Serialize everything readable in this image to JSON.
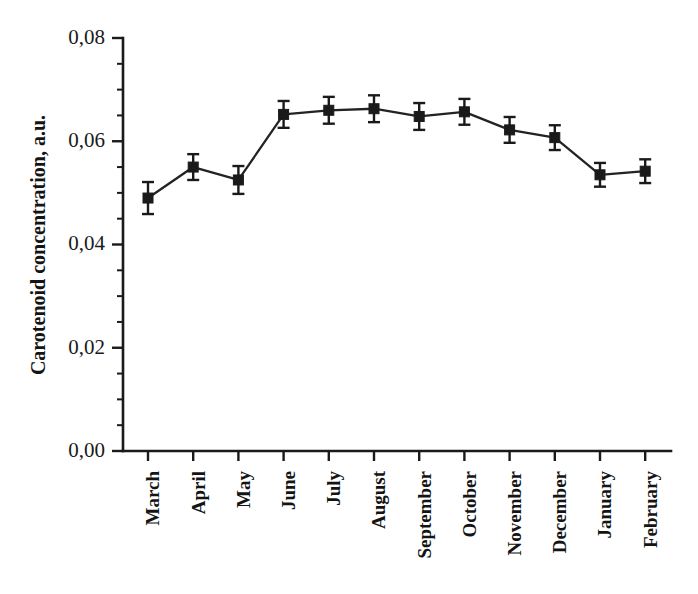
{
  "chart_data": {
    "type": "line",
    "title": "",
    "xlabel": "",
    "ylabel": "Carotenoid concentration, a.u.",
    "categories": [
      "March",
      "April",
      "May",
      "June",
      "July",
      "August",
      "September",
      "October",
      "November",
      "December",
      "January",
      "February"
    ],
    "values": [
      0.049,
      0.055,
      0.0525,
      0.0652,
      0.066,
      0.0663,
      0.0648,
      0.0657,
      0.0622,
      0.0607,
      0.0535,
      0.0542
    ],
    "errors": [
      0.0031,
      0.0025,
      0.0027,
      0.0026,
      0.0026,
      0.0026,
      0.0026,
      0.0025,
      0.0025,
      0.0024,
      0.0023,
      0.0023
    ],
    "ylim": [
      0.0,
      0.08
    ],
    "ytick_labels": [
      "0,00",
      "0,02",
      "0,04",
      "0,06",
      "0,08"
    ],
    "ytick_values": [
      0.0,
      0.02,
      0.04,
      0.06,
      0.08
    ],
    "yminor_count": 4,
    "grid": false,
    "legend": "none",
    "marker": "square",
    "line_color": "#232323",
    "marker_color": "#1a1a1a",
    "axis_color": "#1a1a1a",
    "background": "#ffffff",
    "xlabel_rotation": 90
  }
}
